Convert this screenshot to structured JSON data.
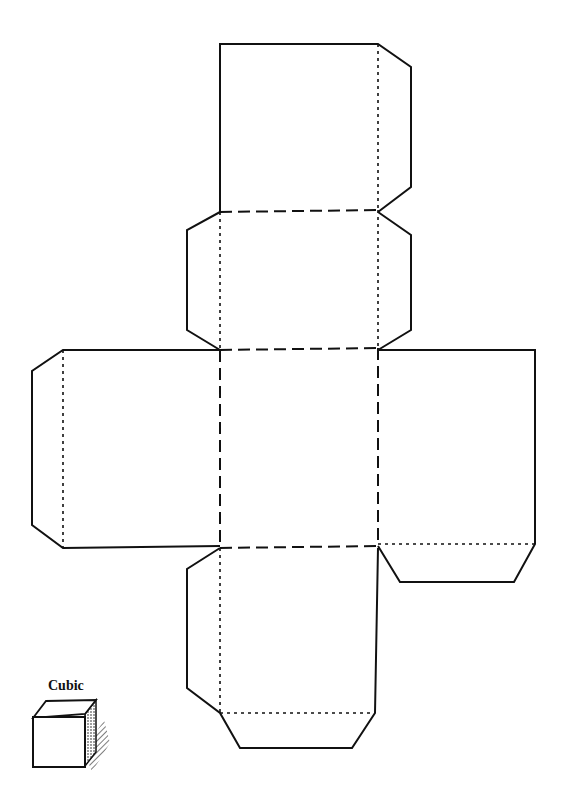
{
  "diagram": {
    "title": "Cubic",
    "type": "cube-net",
    "faces": 6,
    "legend": {
      "solid": "cut line",
      "dashed": "fold line",
      "dotted": "tab fold line"
    },
    "footer_text": "",
    "colors": {
      "line": "#111111",
      "background": "#ffffff"
    }
  }
}
